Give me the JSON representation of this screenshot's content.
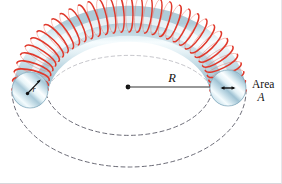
{
  "figure": {
    "labels": {
      "area_line1": "Area",
      "area_line2": "A",
      "major_radius": "R",
      "minor_radius": "r"
    },
    "colors": {
      "coil_wire": "#e0392c",
      "coil_wire_light": "#f07a6c",
      "tube_light": "#f4fbfd",
      "tube_mid": "#bcd9e4",
      "tube_shadow": "#8fb3c4",
      "dashed_guide": "#5a5a66",
      "radius_line": "#1a1a1a",
      "label_text": "#111111",
      "background": "#ffffff"
    },
    "geometry": {
      "left_section_center_x": 30,
      "left_section_center_y": 90,
      "left_section_radius": 18,
      "right_section_center_x": 228,
      "right_section_center_y": 88,
      "right_section_radius": 18,
      "center_dot_x": 128,
      "center_dot_y": 87,
      "coil_turns": 34
    }
  }
}
